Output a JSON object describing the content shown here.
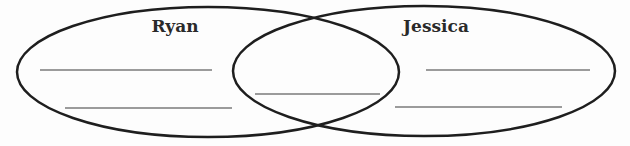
{
  "diagram": {
    "type": "venn",
    "colors": {
      "outline": "#1e1e1e",
      "blank_line": "#7a7a7a",
      "text": "#2a2a2a",
      "background": "#fdfdfd"
    },
    "sets": [
      {
        "label": "Ryan",
        "blank_lines": 2
      },
      {
        "label": "Jessica",
        "blank_lines": 2
      }
    ],
    "intersection": {
      "blank_lines": 1
    }
  }
}
